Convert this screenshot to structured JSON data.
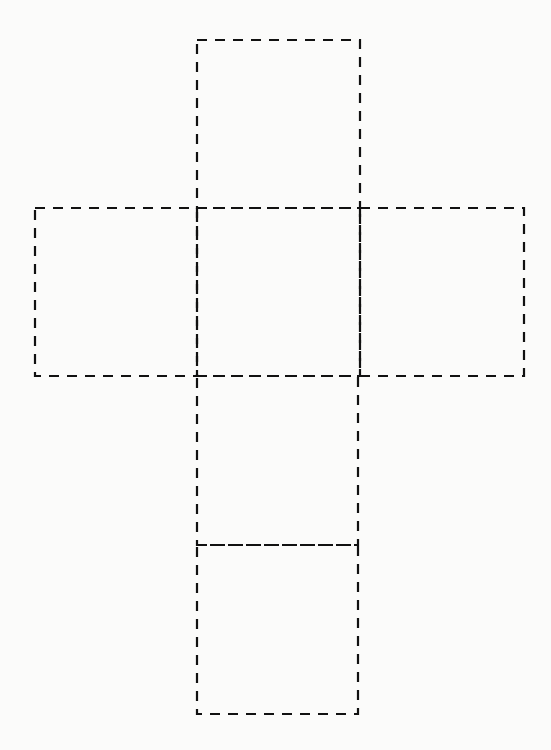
{
  "diagram": {
    "type": "cube-net",
    "title": "",
    "line_style": "dashed",
    "line_color": "#111111",
    "background": "#fbfbfa",
    "faces": [
      {
        "id": "top",
        "x": 197,
        "y": 40,
        "w": 163,
        "h": 168
      },
      {
        "id": "left",
        "x": 35,
        "y": 208,
        "w": 162,
        "h": 168
      },
      {
        "id": "center",
        "x": 197,
        "y": 208,
        "w": 163,
        "h": 168
      },
      {
        "id": "right",
        "x": 360,
        "y": 208,
        "w": 164,
        "h": 168
      },
      {
        "id": "lower",
        "x": 197,
        "y": 376,
        "w": 161,
        "h": 169
      },
      {
        "id": "bottom",
        "x": 197,
        "y": 545,
        "w": 161,
        "h": 169
      }
    ]
  }
}
